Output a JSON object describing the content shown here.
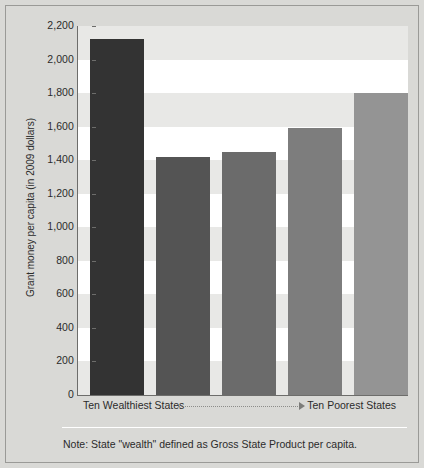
{
  "chart_data": {
    "type": "bar",
    "title": "",
    "xlabel": "",
    "ylabel": "Grant money per capita (in 2009 dollars)",
    "categories": [
      "1",
      "2",
      "3",
      "4",
      "5"
    ],
    "values": [
      2125,
      1420,
      1450,
      1590,
      1800
    ],
    "ylim": [
      0,
      2200
    ],
    "y_ticks": [
      {
        "value": 2200,
        "label": "2,200"
      },
      {
        "value": 2000,
        "label": "2,000"
      },
      {
        "value": 1800,
        "label": "1,800"
      },
      {
        "value": 1600,
        "label": "1,600"
      },
      {
        "value": 1400,
        "label": "1,400"
      },
      {
        "value": 1200,
        "label": "1,200"
      },
      {
        "value": 1000,
        "label": "1,000"
      },
      {
        "value": 800,
        "label": "800"
      },
      {
        "value": 600,
        "label": "600"
      },
      {
        "value": 400,
        "label": "400"
      },
      {
        "value": 200,
        "label": "200"
      },
      {
        "value": 0,
        "label": "0"
      }
    ],
    "bar_colors": [
      "#333333",
      "#545454",
      "#6b6b6b",
      "#7d7d7d",
      "#949494"
    ],
    "grid": "horizontal-bands",
    "legend": "none",
    "x_axis_left_label": "Ten Wealthiest States",
    "x_axis_right_label": "Ten Poorest States",
    "note": "Note: State \"wealth\" defined as Gross State Product per capita."
  },
  "colors": {
    "figure_background": "#d9d9d6",
    "plot_background": "#ffffff",
    "band": "#e8e8e6",
    "axis": "#6d6d6b",
    "text": "#2b2b2b"
  }
}
